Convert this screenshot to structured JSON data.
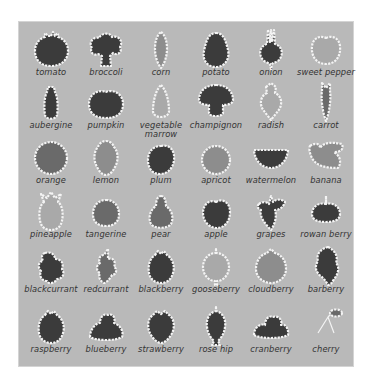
{
  "sheet": {
    "title": "",
    "colors": {
      "panel": "#b9b9b9",
      "icon_dark": "#3b3b3b",
      "icon_mid": "#6a6a6a",
      "outline": "#f4f4f4",
      "label": "#333333"
    },
    "rows": [
      {
        "items": [
          {
            "label": "tomato",
            "icon": "tomato-icon"
          },
          {
            "label": "broccoli",
            "icon": "broccoli-icon"
          },
          {
            "label": "corn",
            "icon": "corn-icon"
          },
          {
            "label": "potato",
            "icon": "potato-icon"
          },
          {
            "label": "onion",
            "icon": "onion-icon"
          },
          {
            "label": "sweet pepper",
            "icon": "sweet-pepper-icon"
          }
        ]
      },
      {
        "items": [
          {
            "label": "aubergine",
            "icon": "aubergine-icon"
          },
          {
            "label": "pumpkin",
            "icon": "pumpkin-icon"
          },
          {
            "label": "vegetable marrow",
            "icon": "vegetable-marrow-icon"
          },
          {
            "label": "champignon",
            "icon": "champignon-icon"
          },
          {
            "label": "radish",
            "icon": "radish-icon"
          },
          {
            "label": "carrot",
            "icon": "carrot-icon"
          }
        ]
      },
      {
        "items": [
          {
            "label": "orange",
            "icon": "orange-icon"
          },
          {
            "label": "lemon",
            "icon": "lemon-icon"
          },
          {
            "label": "plum",
            "icon": "plum-icon"
          },
          {
            "label": "apricot",
            "icon": "apricot-icon"
          },
          {
            "label": "watermelon",
            "icon": "watermelon-icon"
          },
          {
            "label": "banana",
            "icon": "banana-icon"
          }
        ]
      },
      {
        "items": [
          {
            "label": "pineapple",
            "icon": "pineapple-icon"
          },
          {
            "label": "tangerine",
            "icon": "tangerine-icon"
          },
          {
            "label": "pear",
            "icon": "pear-icon"
          },
          {
            "label": "apple",
            "icon": "apple-icon"
          },
          {
            "label": "grapes",
            "icon": "grapes-icon"
          },
          {
            "label": "rowan berry",
            "icon": "rowan-berry-icon"
          }
        ]
      },
      {
        "items": [
          {
            "label": "blackcurrant",
            "icon": "blackcurrant-icon"
          },
          {
            "label": "redcurrant",
            "icon": "redcurrant-icon"
          },
          {
            "label": "blackberry",
            "icon": "blackberry-icon"
          },
          {
            "label": "gooseberry",
            "icon": "gooseberry-icon"
          },
          {
            "label": "cloudberry",
            "icon": "cloudberry-icon"
          },
          {
            "label": "barberry",
            "icon": "barberry-icon"
          }
        ]
      },
      {
        "items": [
          {
            "label": "raspberry",
            "icon": "raspberry-icon"
          },
          {
            "label": "blueberry",
            "icon": "blueberry-icon"
          },
          {
            "label": "strawberry",
            "icon": "strawberry-icon"
          },
          {
            "label": "rose hip",
            "icon": "rose-hip-icon"
          },
          {
            "label": "cranberry",
            "icon": "cranberry-icon"
          },
          {
            "label": "cherry",
            "icon": "cherry-icon"
          }
        ]
      }
    ]
  }
}
